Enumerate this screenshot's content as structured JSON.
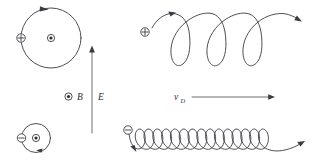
{
  "figure": {
    "background_color": "#ffffff",
    "stroke_color": "#3a3a42",
    "text_color": "#2c2c33",
    "width": 317,
    "height": 164
  },
  "field_labels": {
    "magnetic": {
      "symbol": "B",
      "icon": "b-field-out-of-page-icon",
      "description": "circle with center dot, B out of page"
    },
    "electric": {
      "symbol": "E",
      "icon": "e-field-arrow-icon",
      "direction": "up",
      "description": "vertical upward arrow"
    }
  },
  "drift": {
    "symbol": "v",
    "subscript": "D",
    "icon": "drift-velocity-arrow-icon",
    "direction": "right"
  },
  "panels": [
    {
      "id": "positive-circular-orbit",
      "name": "positive-charge-circular-orbit",
      "charge_symbol": "+",
      "charge_icon": "positive-charge-icon",
      "center_icon": "b-field-out-of-page-icon",
      "path_type": "circle",
      "sense": "clockwise",
      "loops": 1
    },
    {
      "id": "negative-circular-orbit",
      "name": "negative-charge-circular-orbit",
      "charge_symbol": "−",
      "charge_icon": "negative-charge-icon",
      "center_icon": "b-field-out-of-page-icon",
      "path_type": "circle",
      "sense": "counterclockwise",
      "loops": 1
    },
    {
      "id": "positive-cycloid",
      "name": "positive-charge-trochoid-path",
      "charge_symbol": "+",
      "charge_icon": "positive-charge-icon",
      "path_type": "prolate-cycloid",
      "loops": 3,
      "drift_direction": "right",
      "loop_orientation": "below-axis"
    },
    {
      "id": "negative-cycloid",
      "name": "negative-charge-trochoid-path",
      "charge_symbol": "−",
      "charge_icon": "negative-charge-icon",
      "path_type": "prolate-cycloid",
      "loops": 10,
      "drift_direction": "right",
      "loop_orientation": "above-axis"
    }
  ]
}
